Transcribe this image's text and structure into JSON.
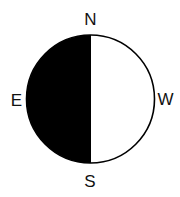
{
  "diagram": {
    "title": "",
    "shape": "circle",
    "fill": {
      "filled_half": "left",
      "filled_color": "#000000",
      "unfilled_color": "#ffffff",
      "outline_color": "#000000"
    },
    "labels": {
      "top": "N",
      "left": "E",
      "right": "W",
      "bottom": "S"
    }
  }
}
